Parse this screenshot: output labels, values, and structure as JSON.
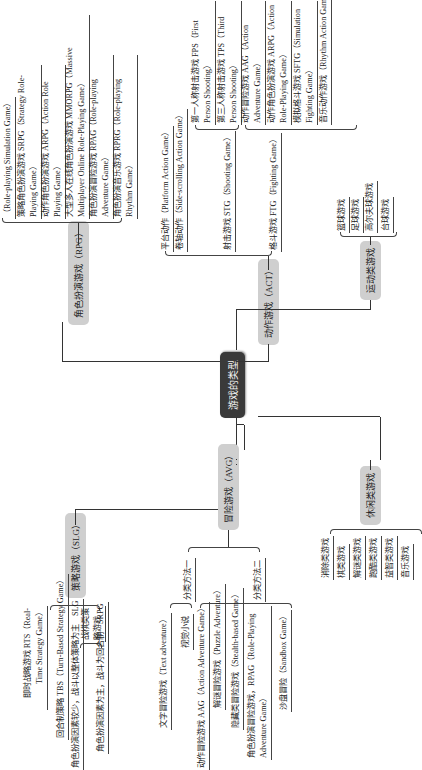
{
  "root": {
    "label": "游戏的类型"
  },
  "branches": {
    "rpg": {
      "label": "角色扮演游戏（RPG）",
      "items": [
        "（Role-playing Simulation Game）",
        "策略角色扮演游戏 SRPG（Strategy Role-Playing Game）",
        "动作角色扮演游戏 ARPG（Action Role Playing Game）",
        "大型多人在线角色扮演游戏 MMORPG（Massive Multiplayer Online Role-Playing Game）",
        "角色扮演冒险游戏 RPAG（Role-playing Adventure Game）",
        "角色扮演音乐游戏 RPRG（Role-playing Rhythm Game）"
      ]
    },
    "act": {
      "label": "动作游戏（ACT）",
      "items": [
        "平台动作（Platform Action Game）",
        "卷轴动作（Side-scrolling Action Game）",
        "射击游戏 STG（Shooting Game）",
        "格斗游戏 FTG（Fighting Game）"
      ],
      "stg_items": [
        "第一人称射击游戏 FPS（First Person Shooting）",
        "第三人称射击游戏 TPS（Third Person Shooting）"
      ],
      "ftg_items": [
        "动作冒险游戏 AAG（Action Adventure Game）",
        "动作角色扮演游戏 ARPG（Action Role-Playing Game）",
        "模拟格斗游戏 SFTG（Simulation Fighting Game）",
        "音乐动作游戏（Rhythm Action Game）"
      ]
    },
    "sports": {
      "label": "运动类游戏",
      "items": [
        "篮球游戏",
        "足球游戏",
        "高尔夫球游戏",
        "台球游戏"
      ]
    },
    "slg": {
      "label": "策略游戏（SLG）",
      "items": [
        "即时战略游戏 RTS（Real-Time Strategy Game）",
        "回合制策略 TBS（Turn-Based Strategy Game）",
        "战棋类策略游戏"
      ],
      "sub_items": [
        "角色扮演因素较少，战斗以整体策略为主　SLG",
        "角色扮演因素为主，战斗为回合制　SRPG"
      ]
    },
    "avg": {
      "label": "冒险游戏（AVG）",
      "method1": "分类方法一",
      "method1_items": [
        "文字冒险游戏（Text adventure）",
        "视觉小说"
      ],
      "method2": "分类方法二",
      "method2_items": [
        "动作冒险游戏 AAG（Action Adventure Game）",
        "解谜冒险游戏（Puzzle Adventure）",
        "隐藏类冒险游戏（Stealth-based Game）",
        "角色扮演冒险游戏，RPAG（Role-Playing Adventure Game）",
        "沙盘冒险（Sandbox Game）"
      ]
    },
    "casual": {
      "label": "休闲类游戏",
      "items": [
        "消除类游戏",
        "棋类游戏",
        "解谜类游戏",
        "跑酷类游戏",
        "益智类游戏",
        "音乐游戏"
      ]
    }
  }
}
